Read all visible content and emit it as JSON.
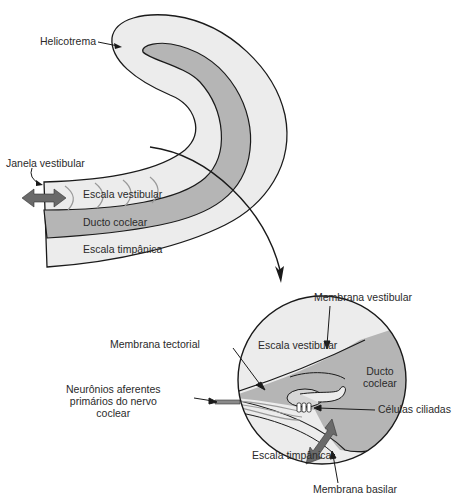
{
  "diagram": {
    "type": "anatomical-illustration",
    "colors": {
      "outer_scala_fill": "#ececec",
      "cochlear_duct_fill": "#b5b5b5",
      "outline": "#1a1a1a",
      "arrow_fill": "#6a6a6a",
      "text": "#2a2a2a",
      "hair_cells_fill": "#ffffff"
    }
  },
  "uncoiled_cochlea": {
    "labels": {
      "helicotrema": "Helicotrema",
      "oval_window": "Janela vestibular",
      "scala_vestibuli": "Escala vestibular",
      "cochlear_duct": "Ducto coclear",
      "scala_tympani": "Escala timpânica"
    }
  },
  "cross_section": {
    "labels": {
      "vestibular_membrane": "Membrana vestibular",
      "tectorial_membrane": "Membrana tectorial",
      "scala_vestibuli": "Escala vestibular",
      "cochlear_duct_line1": "Ducto",
      "cochlear_duct_line2": "coclear",
      "afferent_neurons_line1": "Neurônios aferentes",
      "afferent_neurons_line2": "primários do nervo",
      "afferent_neurons_line3": "coclear",
      "hair_cells": "Células ciliadas",
      "scala_tympani": "Escala timpânica",
      "basilar_membrane": "Membrana basilar"
    }
  }
}
